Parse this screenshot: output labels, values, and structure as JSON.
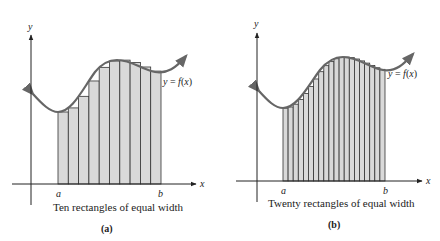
{
  "figure": {
    "panels": [
      {
        "id": "a",
        "caption": "Ten rectangles of equal width",
        "sublabel": "(a)",
        "y_axis_label": "y",
        "x_axis_label": "x",
        "a_label": "a",
        "b_label": "b",
        "curve_label": "y = f(x)",
        "rectangle_count": 10
      },
      {
        "id": "b",
        "caption": "Twenty rectangles of equal width",
        "sublabel": "(b)",
        "y_axis_label": "y",
        "x_axis_label": "x",
        "a_label": "a",
        "b_label": "b",
        "curve_label": "y = f(x)",
        "rectangle_count": 20
      }
    ],
    "colors": {
      "rect_fill": "#d9d9d9",
      "rect_stroke": "#333333",
      "curve": "#666666",
      "axis": "#222222"
    }
  }
}
